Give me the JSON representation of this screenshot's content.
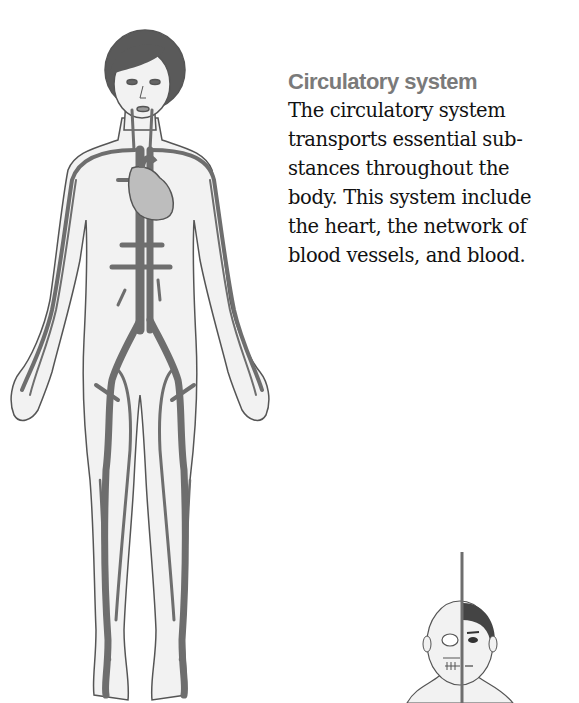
{
  "section": {
    "heading": "Circulatory system",
    "body_lines": [
      "The circulatory system",
      "transports essential sub-",
      "stances throughout the",
      "body. This system include",
      "the heart, the network of",
      "blood vessels, and blood."
    ]
  },
  "illustrations": {
    "main": "full-body-circulatory-system-figure",
    "secondary": "half-skull-half-face-head-figure"
  },
  "colors": {
    "heading": "#7a7a7a",
    "text": "#111111",
    "vessel": "#6e6e6e",
    "body_fill": "#f2f2f2",
    "outline": "#555555",
    "hair": "#5a5a5a",
    "heart": "#bdbdbd"
  }
}
